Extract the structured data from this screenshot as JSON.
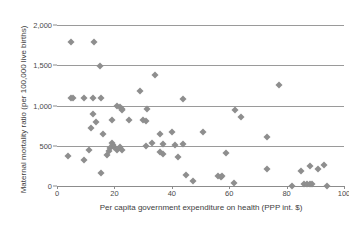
{
  "chart_data": {
    "type": "scatter",
    "title": "",
    "xlabel": "Per capita government expenditure on health (PPP int. $)",
    "ylabel": "Maternal mortality ratio (per 100,000 live births)",
    "xlim": [
      0,
      100
    ],
    "ylim": [
      0,
      2000
    ],
    "xticks": [
      0,
      20,
      40,
      60,
      80,
      100
    ],
    "xticklabels": [
      "0",
      "20",
      "40",
      "60",
      "80",
      "100"
    ],
    "yticks": [
      0,
      500,
      1000,
      1500,
      2000
    ],
    "yticklabels": [
      "0",
      "500",
      "1,000",
      "1,500",
      "2,000"
    ],
    "grid": "horizontal",
    "legend": "none",
    "marker": "diamond",
    "marker_color": "#8e8e8e",
    "gridline_color": "#9a9a9a",
    "axis_color": "#8c8c8c",
    "points": [
      [
        5,
        1790
      ],
      [
        13,
        1790
      ],
      [
        15,
        1490
      ],
      [
        34,
        1380
      ],
      [
        77.5,
        1260
      ],
      [
        29,
        1180
      ],
      [
        5,
        1090
      ],
      [
        5.7,
        1090
      ],
      [
        9.5,
        1090
      ],
      [
        12.5,
        1090
      ],
      [
        15.5,
        1090
      ],
      [
        44,
        1080
      ],
      [
        21,
        990
      ],
      [
        22,
        980
      ],
      [
        22.5,
        960
      ],
      [
        22.8,
        940
      ],
      [
        31.5,
        960
      ],
      [
        62,
        940
      ],
      [
        12.5,
        900
      ],
      [
        64,
        855
      ],
      [
        13.5,
        800
      ],
      [
        19,
        820
      ],
      [
        25,
        820
      ],
      [
        30,
        815
      ],
      [
        31,
        810
      ],
      [
        12,
        725
      ],
      [
        51,
        675
      ],
      [
        40,
        665
      ],
      [
        36,
        645
      ],
      [
        73,
        610
      ],
      [
        16,
        645
      ],
      [
        37,
        525
      ],
      [
        41,
        515
      ],
      [
        44,
        525
      ],
      [
        19,
        535
      ],
      [
        19.5,
        505
      ],
      [
        20,
        490
      ],
      [
        22,
        480
      ],
      [
        31,
        495
      ],
      [
        33,
        540
      ],
      [
        18.5,
        470
      ],
      [
        21,
        450
      ],
      [
        22.5,
        445
      ],
      [
        59,
        410
      ],
      [
        36,
        420
      ],
      [
        37,
        400
      ],
      [
        42,
        355
      ],
      [
        9.5,
        320
      ],
      [
        4,
        375
      ],
      [
        17.5,
        390
      ],
      [
        18,
        430
      ],
      [
        11,
        445
      ],
      [
        88,
        250
      ],
      [
        93,
        255
      ],
      [
        91,
        210
      ],
      [
        85,
        185
      ],
      [
        73,
        205
      ],
      [
        15.5,
        165
      ],
      [
        45,
        135
      ],
      [
        56,
        120
      ],
      [
        57,
        115
      ],
      [
        57.5,
        125
      ],
      [
        47.5,
        60
      ],
      [
        61.5,
        35
      ],
      [
        82,
        5
      ],
      [
        86,
        20
      ],
      [
        87,
        25
      ],
      [
        88,
        20
      ],
      [
        89,
        30
      ],
      [
        94,
        0
      ]
    ]
  }
}
